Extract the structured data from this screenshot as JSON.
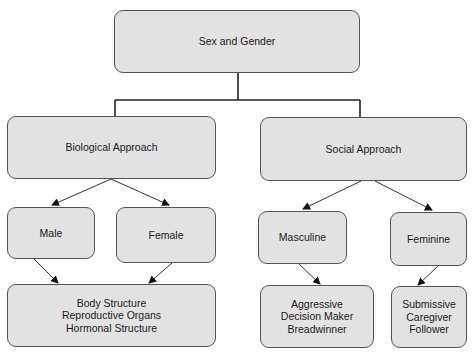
{
  "diagram": {
    "type": "hierarchy",
    "colors": {
      "node_fill": "#e2e2e2",
      "node_border": "#555555",
      "line": "#222222",
      "text": "#1a1a1a"
    },
    "root": {
      "label": "Sex and Gender"
    },
    "branches": [
      {
        "label": "Biological Approach",
        "children": [
          {
            "label": "Male"
          },
          {
            "label": "Female"
          }
        ],
        "outcome": {
          "lines": [
            "Body Structure",
            "Reproductive Organs",
            "Hormonal Structure"
          ]
        }
      },
      {
        "label": "Social Approach",
        "children": [
          {
            "label": "Masculine",
            "outcome": {
              "lines": [
                "Aggressive",
                "Decision Maker",
                "Breadwinner"
              ]
            }
          },
          {
            "label": "Feminine",
            "outcome": {
              "lines": [
                "Submissive",
                "Caregiver",
                "Follower"
              ]
            }
          }
        ]
      }
    ]
  }
}
